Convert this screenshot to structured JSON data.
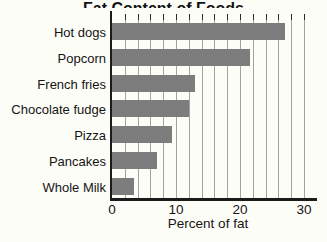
{
  "chart_data": {
    "type": "bar",
    "orientation": "horizontal",
    "title": "Fat Content of Foods",
    "title_clipped_at_top": true,
    "categories": [
      "Hot dogs",
      "Popcorn",
      "French fries",
      "Chocolate fudge",
      "Pizza",
      "Pancakes",
      "Whole Milk"
    ],
    "values": [
      27,
      21.5,
      13,
      12,
      9.3,
      7,
      3.4
    ],
    "xlabel": "Percent of fat",
    "xticks": [
      0,
      10,
      20,
      30
    ],
    "xlim": [
      0,
      32
    ],
    "minor_grid_step": 2,
    "grid": true,
    "legend": false,
    "bar_color": "#7d7d7d",
    "grid_color": "#a3a3a3",
    "axis_color": "#1b1b1b",
    "text_color": "#141414",
    "background_color": "#fdfdf8"
  }
}
